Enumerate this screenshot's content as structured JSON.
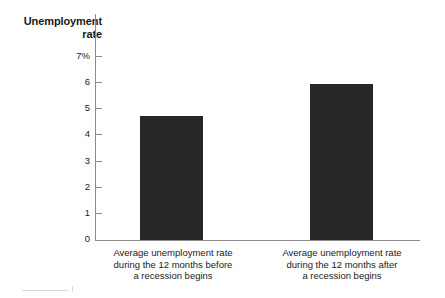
{
  "chart_data": {
    "type": "bar",
    "title": "Unemployment rate",
    "title_line1": "Unemployment",
    "title_line2": "rate",
    "xlabel": "",
    "ylabel": "Unemployment rate",
    "ylim": [
      0,
      7
    ],
    "grid": false,
    "legend": "none",
    "y_unit": "%",
    "y_ticks": [
      {
        "value": 7,
        "label": "7%"
      },
      {
        "value": 6,
        "label": "6"
      },
      {
        "value": 5,
        "label": "5"
      },
      {
        "value": 4,
        "label": "4"
      },
      {
        "value": 3,
        "label": "3"
      },
      {
        "value": 2,
        "label": "2"
      },
      {
        "value": 1,
        "label": "1"
      },
      {
        "value": 0,
        "label": "0"
      }
    ],
    "categories": [
      "Average unemployment rate during the 12 months before a recession begins",
      "Average unemployment rate during the 12 months after a recession begins"
    ],
    "values": [
      4.75,
      5.95
    ],
    "bars": [
      {
        "value": 4.75,
        "caption_line1": "Average unemployment rate",
        "caption_line2": "during the 12 months before",
        "caption_line3": "a recession begins",
        "color": "#262626"
      },
      {
        "value": 5.95,
        "caption_line1": "Average unemployment rate",
        "caption_line2": "during the 12 months after",
        "caption_line3": "a recession begins",
        "color": "#262626"
      }
    ],
    "colors": {
      "bar": "#262626",
      "axis": "#8c8c8c",
      "text": "#1a1a1a",
      "background": "#ffffff"
    }
  }
}
